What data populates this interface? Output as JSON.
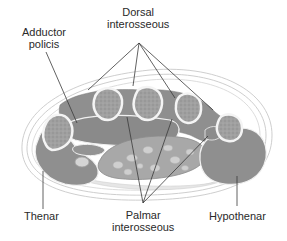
{
  "diagram": {
    "labels": {
      "adductor_line1": "Adductor",
      "adductor_line2": "policis",
      "dorsal_line1": "Dorsal",
      "dorsal_line2": "interosseous",
      "thenar": "Thenar",
      "palmar_line1": "Palmar",
      "palmar_line2": "interosseous",
      "hypothenar": "Hypothenar"
    },
    "colors": {
      "muscle": "#8f8f8f",
      "muscle_dark": "#7d7d7d",
      "bone_outline": "#f4f4f4",
      "bone_fill": "#a3a3a3",
      "skin_outline": "#c8c8c8",
      "leader_line": "#3a3a3a",
      "text": "#2a2a2a"
    }
  }
}
